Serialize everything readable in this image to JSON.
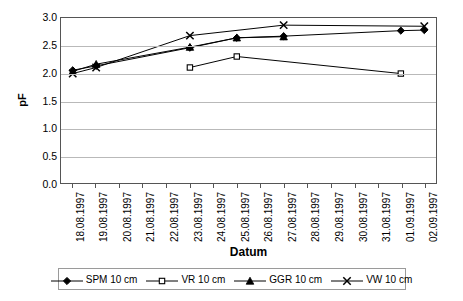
{
  "chart_data": {
    "type": "line",
    "title": "",
    "xlabel": "Datum",
    "ylabel": "pF",
    "ylim": [
      0.0,
      3.0
    ],
    "yticks": [
      "0.0",
      "0.5",
      "1.0",
      "1.5",
      "2.0",
      "2.5",
      "3.0"
    ],
    "ytick_values": [
      0.0,
      0.5,
      1.0,
      1.5,
      2.0,
      2.5,
      3.0
    ],
    "grid": true,
    "legend_position": "bottom",
    "categories": [
      "18.08.1997",
      "19.08.1997",
      "20.08.1997",
      "21.08.1997",
      "22.08.1997",
      "23.08.1997",
      "24.08.1997",
      "25.08.1997",
      "26.08.1997",
      "27.08.1997",
      "28.08.1997",
      "29.08.1997",
      "30.08.1997",
      "31.08.1997",
      "01.09.1997",
      "02.09.1997"
    ],
    "series": [
      {
        "name": "SPM 10 cm",
        "marker": "filled-diamond",
        "color": "#000000",
        "values": [
          2.05,
          2.13,
          null,
          null,
          null,
          2.46,
          null,
          2.64,
          null,
          2.67,
          null,
          null,
          null,
          null,
          2.77,
          2.78
        ]
      },
      {
        "name": "VR 10 cm",
        "marker": "open-square",
        "color": "#000000",
        "values": [
          null,
          null,
          null,
          null,
          null,
          2.1,
          null,
          2.3,
          null,
          null,
          null,
          null,
          null,
          null,
          1.99,
          null
        ]
      },
      {
        "name": "GGR 10 cm",
        "marker": "filled-triangle",
        "color": "#000000",
        "values": [
          2.03,
          2.16,
          null,
          null,
          null,
          2.47,
          null,
          2.64,
          null,
          2.66,
          null,
          null,
          null,
          null,
          null,
          null
        ]
      },
      {
        "name": "VW 10 cm",
        "marker": "cross-x",
        "color": "#000000",
        "values": [
          1.99,
          2.1,
          null,
          null,
          null,
          2.68,
          null,
          null,
          null,
          2.87,
          null,
          null,
          null,
          null,
          null,
          2.85
        ]
      }
    ]
  },
  "axes": {
    "y_title": "pF",
    "x_title": "Datum"
  },
  "legend": {
    "entries": [
      {
        "label": "SPM 10 cm",
        "marker": "filled-diamond"
      },
      {
        "label": "VR 10 cm",
        "marker": "open-square"
      },
      {
        "label": "GGR 10 cm",
        "marker": "filled-triangle"
      },
      {
        "label": "VW 10 cm",
        "marker": "cross-x"
      }
    ]
  },
  "colors": {
    "line": "#000000",
    "grid": "#b9b9b9",
    "axis": "#555555",
    "background": "#ffffff"
  }
}
